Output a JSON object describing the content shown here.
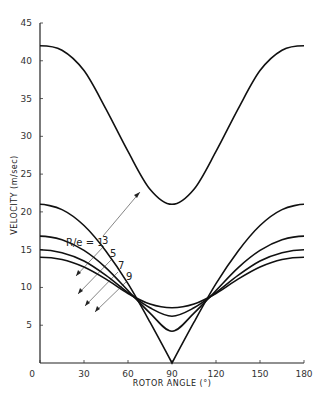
{
  "chart_data": {
    "type": "line",
    "title": "",
    "xlabel": "ROTOR ANGLE (°)",
    "ylabel": "VELOCITY (m/sec)",
    "xlim": [
      0,
      180
    ],
    "ylim": [
      0,
      45
    ],
    "xticks": [
      0,
      30,
      60,
      90,
      120,
      150,
      180
    ],
    "yticks": [
      0,
      5,
      10,
      15,
      20,
      25,
      30,
      35,
      40,
      45
    ],
    "grid": false,
    "legend": "annotations with leader lines",
    "x": [
      0,
      15,
      30,
      45,
      60,
      75,
      90,
      105,
      120,
      135,
      150,
      165,
      180
    ],
    "series": [
      {
        "name": "R/e = 1",
        "values": [
          42.0,
          41.4,
          38.7,
          33.6,
          28.0,
          23.0,
          21.0,
          23.0,
          28.0,
          33.6,
          38.7,
          41.4,
          42.0
        ]
      },
      {
        "name": "3",
        "values": [
          21.0,
          20.3,
          18.2,
          14.8,
          10.5,
          5.4,
          0.0,
          5.4,
          10.5,
          14.8,
          18.2,
          20.3,
          21.0
        ]
      },
      {
        "name": "5",
        "values": [
          16.8,
          16.3,
          14.9,
          12.6,
          9.6,
          6.6,
          4.2,
          6.6,
          9.6,
          12.6,
          14.9,
          16.3,
          16.8
        ]
      },
      {
        "name": "7",
        "values": [
          15.0,
          14.6,
          13.5,
          11.6,
          9.3,
          7.3,
          6.2,
          7.3,
          9.3,
          11.6,
          13.5,
          14.6,
          15.0
        ]
      },
      {
        "name": "9",
        "values": [
          14.0,
          13.7,
          12.7,
          11.1,
          9.2,
          7.8,
          7.3,
          7.8,
          9.2,
          11.1,
          12.7,
          13.7,
          14.0
        ]
      }
    ],
    "annotations": [
      {
        "text": "R/e = 1",
        "points_to_series": "R/e = 1"
      },
      {
        "text": "3",
        "points_to_series": "3"
      },
      {
        "text": "5",
        "points_to_series": "5"
      },
      {
        "text": "7",
        "points_to_series": "7"
      },
      {
        "text": "9",
        "points_to_series": "9"
      }
    ]
  },
  "axes": {
    "xlabel": "ROTOR ANGLE (°)",
    "ylabel": "VELOCITY (m/sec)",
    "xtick_labels": [
      "0",
      "30",
      "60",
      "90",
      "120",
      "150",
      "180"
    ],
    "ytick_labels": [
      "5",
      "10",
      "15",
      "20",
      "25",
      "30",
      "35",
      "40",
      "45"
    ]
  },
  "labels": {
    "re1": "R/e = 1",
    "re3": "3",
    "re5": "5",
    "re7": "7",
    "re9": "9"
  }
}
